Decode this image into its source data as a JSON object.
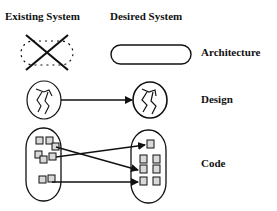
{
  "headers": {
    "existing": "Existing System",
    "desired": "Desired System"
  },
  "rows": [
    {
      "label": "Architecture"
    },
    {
      "label": "Design"
    },
    {
      "label": "Code"
    }
  ],
  "colors": {
    "stroke": "#111111",
    "box_fill": "#d9d9d9",
    "background": "#ffffff"
  }
}
